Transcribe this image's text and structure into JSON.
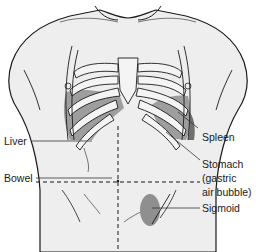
{
  "diagram": {
    "colors": {
      "skin": "#eeeeee",
      "outline": "#1a1a1a",
      "organ_shading": "#8f8f8f",
      "rib_fill": "#f2f2f2",
      "leader_line": "#333333"
    },
    "labels": {
      "liver": "Liver",
      "bowel": "Bowel",
      "spleen": "Spleen",
      "stomach_line1": "Stomach",
      "stomach_line2": "(gastric",
      "stomach_line3": "air bubble)",
      "sigmoid": "Sigmoid"
    }
  }
}
